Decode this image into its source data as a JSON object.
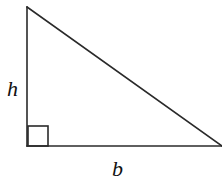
{
  "diagram": {
    "type": "right-triangle",
    "labels": {
      "height": "h",
      "base": "b"
    },
    "stroke_color": "#2a2a2a",
    "vertices": {
      "top": [
        27,
        7
      ],
      "bottom_left": [
        27,
        146
      ],
      "bottom_right": [
        222,
        146
      ]
    },
    "right_angle_marker": true
  }
}
